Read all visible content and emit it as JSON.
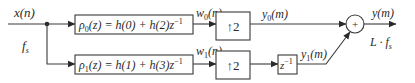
{
  "diagram": {
    "input": {
      "signal_label": "x(n)",
      "rate_label": "f",
      "rate_sub": "s"
    },
    "branches": [
      {
        "filter": {
          "name": "ρ",
          "index": "0",
          "expr_mid": "(z) = h(0) + h(2)z",
          "expr_sup": "−1"
        },
        "filter_output": {
          "name": "w",
          "index": "0",
          "arg": "(n)"
        },
        "upsampler": {
          "symbol": "↑2"
        },
        "branch_output": {
          "name": "y",
          "index": "0",
          "arg": "(m)"
        }
      },
      {
        "filter": {
          "name": "ρ",
          "index": "1",
          "expr_mid": "(z) = h(1) + h(3)z",
          "expr_sup": "−1"
        },
        "filter_output": {
          "name": "w",
          "index": "1",
          "arg": "(n)"
        },
        "upsampler": {
          "symbol": "↑2"
        },
        "delay": {
          "base": "z",
          "sup": "−1"
        },
        "branch_output": {
          "name": "y",
          "index": "1",
          "arg": "(m)"
        }
      }
    ],
    "adder": {
      "symbol": "+"
    },
    "output": {
      "signal_label": "y(m)",
      "rate_label": "L · f",
      "rate_sub": "s"
    }
  }
}
